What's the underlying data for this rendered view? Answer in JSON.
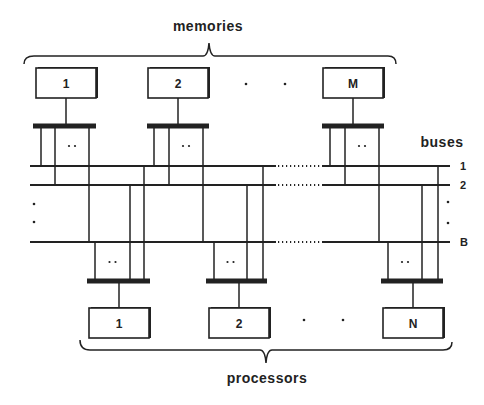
{
  "diagram": {
    "title_top": "memories",
    "title_bottom": "processors",
    "buses_label": "buses",
    "colors": {
      "ink": "#222222",
      "background": "#ffffff"
    },
    "memories": [
      {
        "label": "1",
        "x": 36,
        "bar_x1": 33,
        "bar_x2": 96,
        "verts": [
          41,
          55,
          89
        ]
      },
      {
        "label": "2",
        "x": 148,
        "bar_x1": 147,
        "bar_x2": 209,
        "verts": [
          154,
          169,
          203
        ]
      },
      {
        "label": "M",
        "x": 323,
        "bar_x1": 322,
        "bar_x2": 384,
        "verts": [
          330,
          345,
          379
        ]
      }
    ],
    "memory_ellipsis": "·  ·",
    "processors": [
      {
        "label": "1",
        "x": 89,
        "bar_x1": 87,
        "bar_x2": 150,
        "verts": [
          95,
          130,
          144
        ]
      },
      {
        "label": "2",
        "x": 209,
        "bar_x1": 206,
        "bar_x2": 267,
        "verts": [
          214,
          247,
          263
        ]
      },
      {
        "label": "N",
        "x": 383,
        "bar_x1": 381,
        "bar_x2": 443,
        "verts": [
          388,
          422,
          438
        ]
      }
    ],
    "processor_ellipsis": "·  ·",
    "buses": [
      {
        "label": "1",
        "y": 166
      },
      {
        "label": "2",
        "y": 185
      },
      {
        "label": "B",
        "y": 242
      }
    ],
    "connector_ellipsis": "··",
    "bus_x_start": 30,
    "bus_x_end": 450,
    "bus_gap": [
      276,
      322
    ]
  }
}
